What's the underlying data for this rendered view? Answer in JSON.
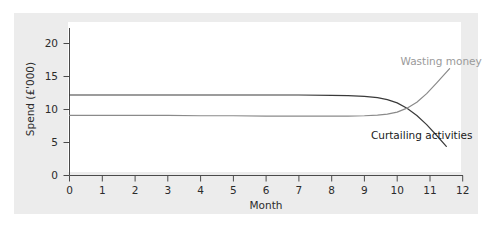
{
  "chart_data": {
    "type": "line",
    "title": "",
    "subtitle": "",
    "xlabel": "Month",
    "ylabel": "Spend (£'000)",
    "xlim": [
      0,
      12
    ],
    "ylim": [
      0,
      21.5
    ],
    "xticks": [
      0,
      1,
      2,
      3,
      4,
      5,
      6,
      7,
      8,
      9,
      10,
      11,
      12
    ],
    "xtick_labels": [
      "0",
      "1",
      "2",
      "3",
      "4",
      "5",
      "6",
      "7",
      "8",
      "9",
      "10",
      "11",
      "12"
    ],
    "yticks": [
      0,
      5,
      10,
      15,
      20
    ],
    "ytick_labels": [
      "0",
      "5",
      "10",
      "15",
      "20"
    ],
    "grid": false,
    "legend_position": "inline-annotation",
    "series": [
      {
        "name": "Curtailing activities",
        "color": "#3a3a3a",
        "label_color": "#1a1a1a",
        "x": [
          0.0,
          1.0,
          2.0,
          3.0,
          4.0,
          5.0,
          6.0,
          7.0,
          8.0,
          8.5,
          9.0,
          9.4,
          9.7,
          10.0,
          10.3,
          10.6,
          10.9,
          11.2,
          11.5
        ],
        "values": [
          12.2,
          12.2,
          12.2,
          12.2,
          12.2,
          12.2,
          12.2,
          12.2,
          12.15,
          12.1,
          12.0,
          11.8,
          11.5,
          11.0,
          10.2,
          9.1,
          7.7,
          6.1,
          4.4
        ]
      },
      {
        "name": "Wasting money",
        "color": "#8a8a8a",
        "label_color": "#9a9a9a",
        "x": [
          0.0,
          1.0,
          2.0,
          3.0,
          4.0,
          5.0,
          6.0,
          7.0,
          8.0,
          8.5,
          9.0,
          9.4,
          9.7,
          10.0,
          10.3,
          10.6,
          10.9,
          11.2,
          11.6
        ],
        "values": [
          9.1,
          9.1,
          9.1,
          9.1,
          9.05,
          9.05,
          9.0,
          9.0,
          9.0,
          9.0,
          9.05,
          9.15,
          9.3,
          9.6,
          10.2,
          11.1,
          12.4,
          14.0,
          16.2
        ]
      }
    ],
    "annotations": [
      {
        "name": "wasting-money-label",
        "text": "Wasting money",
        "x": 10.1,
        "y": 16.7,
        "color": "#9a9a9a"
      },
      {
        "name": "curtailing-activities-label",
        "text": "Curtailing activities",
        "x": 9.2,
        "y": 5.6,
        "color": "#1a1a1a"
      }
    ]
  },
  "colors": {
    "figure_background": "#ffffff",
    "panel_background": "#ececec",
    "plot_background": "#ffffff",
    "axis": "#4a4a4a",
    "text": "#2b2b2b"
  }
}
